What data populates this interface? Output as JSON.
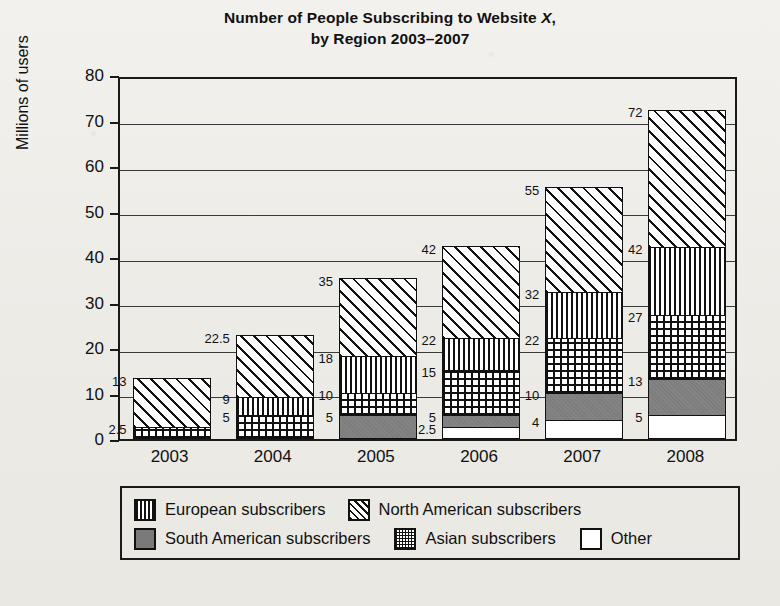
{
  "chart_data": {
    "type": "bar",
    "subtype": "stacked-bar",
    "title": "Number of People Subscribing to Website X,",
    "title_line2": "by Region 2003–2007",
    "title_italic_token": "X",
    "xlabel": "",
    "ylabel": "Millions of users",
    "ylim": [
      0,
      80
    ],
    "ytick_step": 10,
    "yticks": [
      "0",
      "10",
      "20",
      "30",
      "40",
      "50",
      "60",
      "70",
      "80"
    ],
    "grid": "horizontal",
    "legend_position": "below-plot",
    "categories": [
      "2003",
      "2004",
      "2005",
      "2006",
      "2007",
      "2008"
    ],
    "series": [
      {
        "name": "Other",
        "key": "other",
        "values": [
          0,
          0,
          0,
          2.5,
          4,
          5
        ]
      },
      {
        "name": "South American subscribers",
        "key": "southamerican",
        "values": [
          0,
          0,
          5,
          2.5,
          6,
          8
        ]
      },
      {
        "name": "Asian subscribers",
        "key": "asian",
        "values": [
          2.5,
          5,
          5,
          10,
          12,
          14
        ]
      },
      {
        "name": "European subscribers",
        "key": "european",
        "values": [
          0,
          4,
          8,
          7,
          10,
          15
        ]
      },
      {
        "name": "North American subscribers",
        "key": "northamerican",
        "values": [
          10.5,
          13.5,
          17,
          20,
          23,
          30
        ]
      }
    ],
    "cumulative_labels": [
      {
        "category": "2003",
        "labels": [
          "2.5",
          "13"
        ],
        "values": [
          2.5,
          13
        ]
      },
      {
        "category": "2004",
        "labels": [
          "5",
          "9",
          "22.5"
        ],
        "values": [
          5,
          9,
          22.5
        ]
      },
      {
        "category": "2005",
        "labels": [
          "5",
          "10",
          "18",
          "35"
        ],
        "values": [
          5,
          10,
          18,
          35
        ]
      },
      {
        "category": "2006",
        "labels": [
          "2.5",
          "5",
          "15",
          "22",
          "42"
        ],
        "values": [
          2.5,
          5,
          15,
          22,
          42
        ]
      },
      {
        "category": "2007",
        "labels": [
          "4",
          "10",
          "22",
          "32",
          "55"
        ],
        "values": [
          4,
          10,
          22,
          32,
          55
        ]
      },
      {
        "category": "2008",
        "labels": [
          "5",
          "13",
          "27",
          "42",
          "72"
        ],
        "values": [
          5,
          13,
          27,
          42,
          72
        ]
      }
    ],
    "bar_totals": [
      13,
      22.5,
      35,
      43.5,
      55,
      72
    ]
  },
  "legend": {
    "row1": [
      {
        "label": "European subscribers",
        "pattern": "european"
      },
      {
        "label": "North American subscribers",
        "pattern": "northamerican"
      }
    ],
    "row2": [
      {
        "label": "South American subscribers",
        "pattern": "southamerican"
      },
      {
        "label": "Asian subscribers",
        "pattern": "asian"
      },
      {
        "label": "Other",
        "pattern": "other"
      }
    ]
  },
  "colors": {
    "ink": "#111111",
    "paper": "#efeeea",
    "south_american_fill": "#7e7e7e",
    "other_fill": "#ffffff"
  }
}
